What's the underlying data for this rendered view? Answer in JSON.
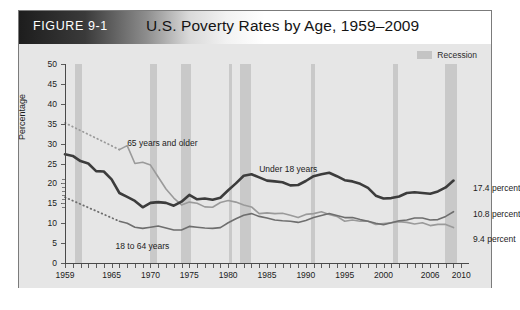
{
  "figure": {
    "label": "FIGURE 9-1",
    "title": "U.S. Poverty Rates by Age, 1959–2009"
  },
  "legend": {
    "items": [
      {
        "label": "Recession",
        "color": "#c9c9c9",
        "type": "band"
      }
    ]
  },
  "annotations": {
    "series_labels": [
      {
        "text": "65 years and older"
      },
      {
        "text": "Under 18 years"
      },
      {
        "text": "18 to 64 years"
      }
    ],
    "end_labels": [
      {
        "text": "17.4 percent"
      },
      {
        "text": "10.8 percent"
      },
      {
        "text": "9.4 percent"
      }
    ]
  },
  "chart_data": {
    "type": "line",
    "title": "U.S. Poverty Rates by Age, 1959–2009",
    "xlabel": "",
    "ylabel": "Percentage",
    "xlim": [
      1959,
      2011
    ],
    "ylim": [
      0,
      50
    ],
    "ytick_values": [
      0,
      5,
      10,
      15,
      20,
      25,
      30,
      35,
      40,
      45,
      50
    ],
    "ytick_labels": [
      "0",
      "5",
      "10",
      "15",
      "20",
      "25",
      "30",
      "35",
      "40",
      "45",
      "50"
    ],
    "xtick_labels": [
      "1959",
      "1965",
      "1970",
      "1975",
      "1980",
      "1985",
      "1990",
      "1995",
      "2000",
      "2006",
      "2010"
    ],
    "xtick_values": [
      1959,
      1965,
      1970,
      1975,
      1980,
      1985,
      1990,
      1995,
      2000,
      2006,
      2010
    ],
    "grid": false,
    "legend_position": "top-right",
    "recession_bands": [
      {
        "start": 1960.3,
        "end": 1961.2
      },
      {
        "start": 1969.9,
        "end": 1970.9
      },
      {
        "start": 1973.9,
        "end": 1975.2
      },
      {
        "start": 1980.1,
        "end": 1980.5
      },
      {
        "start": 1981.5,
        "end": 1982.9
      },
      {
        "start": 1990.6,
        "end": 1991.2
      },
      {
        "start": 2001.2,
        "end": 2001.9
      },
      {
        "start": 2007.9,
        "end": 2009.5
      }
    ],
    "series": [
      {
        "name": "Under 18 years",
        "color": "#3c3c3c",
        "width": 2.6,
        "style": "solid",
        "end_value": 17.4,
        "x": [
          1959,
          1960,
          1961,
          1962,
          1963,
          1964,
          1965,
          1966,
          1967,
          1968,
          1969,
          1970,
          1971,
          1972,
          1973,
          1974,
          1975,
          1976,
          1977,
          1978,
          1979,
          1980,
          1981,
          1982,
          1983,
          1984,
          1985,
          1986,
          1987,
          1988,
          1989,
          1990,
          1991,
          1992,
          1993,
          1994,
          1995,
          1996,
          1997,
          1998,
          1999,
          2000,
          2001,
          2002,
          2003,
          2004,
          2005,
          2006,
          2007,
          2008,
          2009
        ],
        "values": [
          27.3,
          26.9,
          25.6,
          25.0,
          23.1,
          23.0,
          21.0,
          17.6,
          16.6,
          15.6,
          14.0,
          15.1,
          15.3,
          15.1,
          14.4,
          15.4,
          17.1,
          16.0,
          16.2,
          15.9,
          16.4,
          18.3,
          20.0,
          21.9,
          22.3,
          21.5,
          20.7,
          20.5,
          20.3,
          19.5,
          19.6,
          20.6,
          21.8,
          22.3,
          22.7,
          21.8,
          20.8,
          20.5,
          19.9,
          18.9,
          16.9,
          16.2,
          16.3,
          16.7,
          17.6,
          17.8,
          17.6,
          17.4,
          18.0,
          19.0,
          20.7
        ]
      },
      {
        "name": "65 years and older",
        "color": "#9a9a9a",
        "width": 1.6,
        "style": "solid",
        "end_value": 9.4,
        "x": [
          1966,
          1967,
          1968,
          1969,
          1970,
          1971,
          1972,
          1973,
          1974,
          1975,
          1976,
          1977,
          1978,
          1979,
          1980,
          1981,
          1982,
          1983,
          1984,
          1985,
          1986,
          1987,
          1988,
          1989,
          1990,
          1991,
          1992,
          1993,
          1994,
          1995,
          1996,
          1997,
          1998,
          1999,
          2000,
          2001,
          2002,
          2003,
          2004,
          2005,
          2006,
          2007,
          2008,
          2009
        ],
        "values": [
          28.5,
          29.5,
          25.0,
          25.3,
          24.6,
          21.6,
          18.6,
          16.3,
          14.6,
          15.3,
          15.0,
          14.1,
          14.0,
          15.2,
          15.7,
          15.3,
          14.6,
          14.1,
          12.4,
          12.6,
          12.4,
          12.5,
          12.0,
          11.4,
          12.2,
          12.4,
          12.9,
          12.2,
          11.7,
          10.5,
          10.8,
          10.5,
          10.5,
          9.7,
          9.9,
          10.1,
          10.4,
          10.2,
          9.8,
          10.1,
          9.4,
          9.7,
          9.7,
          8.9
        ]
      },
      {
        "name": "18 to 64 years",
        "color": "#6e6e6e",
        "width": 1.6,
        "style": "solid",
        "end_value": 10.8,
        "x": [
          1966,
          1967,
          1968,
          1969,
          1970,
          1971,
          1972,
          1973,
          1974,
          1975,
          1976,
          1977,
          1978,
          1979,
          1980,
          1981,
          1982,
          1983,
          1984,
          1985,
          1986,
          1987,
          1988,
          1989,
          1990,
          1991,
          1992,
          1993,
          1994,
          1995,
          1996,
          1997,
          1998,
          1999,
          2000,
          2001,
          2002,
          2003,
          2004,
          2005,
          2006,
          2007,
          2008,
          2009
        ],
        "values": [
          10.5,
          10.0,
          9.0,
          8.7,
          9.0,
          9.3,
          8.8,
          8.3,
          8.3,
          9.2,
          9.0,
          8.8,
          8.7,
          8.9,
          10.1,
          11.1,
          12.0,
          12.4,
          11.7,
          11.3,
          10.8,
          10.6,
          10.5,
          10.2,
          10.7,
          11.4,
          11.9,
          12.4,
          11.9,
          11.4,
          11.4,
          10.9,
          10.5,
          10.0,
          9.6,
          10.1,
          10.6,
          10.8,
          11.3,
          11.3,
          10.8,
          10.9,
          11.7,
          12.9
        ]
      }
    ],
    "dotted_extensions": [
      {
        "name": "65 years and older (estimated)",
        "color": "#9a9a9a",
        "x": [
          1959,
          1966
        ],
        "values": [
          35.2,
          28.5
        ]
      },
      {
        "name": "18 to 64 years (estimated)",
        "color": "#6e6e6e",
        "x": [
          1959,
          1966
        ],
        "values": [
          16.5,
          10.5
        ]
      }
    ]
  }
}
